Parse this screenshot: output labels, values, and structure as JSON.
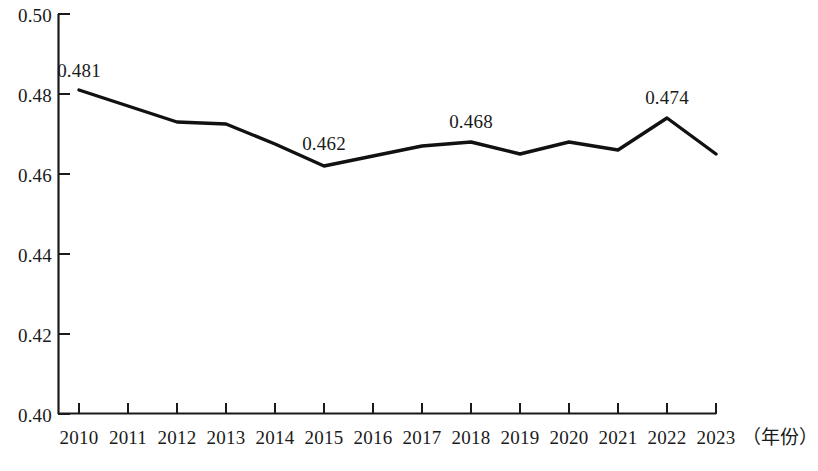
{
  "chart_data": {
    "type": "line",
    "title": "",
    "subtitle": "",
    "xlabel": "（年份）",
    "ylabel": "",
    "categories": [
      "2010",
      "2011",
      "2012",
      "2013",
      "2014",
      "2015",
      "2016",
      "2017",
      "2018",
      "2019",
      "2020",
      "2021",
      "2022",
      "2023"
    ],
    "x": [
      2010,
      2011,
      2012,
      2013,
      2014,
      2015,
      2016,
      2017,
      2018,
      2019,
      2020,
      2021,
      2022,
      2023
    ],
    "values": [
      0.481,
      0.477,
      0.473,
      0.4725,
      0.4675,
      0.462,
      0.4645,
      0.467,
      0.468,
      0.465,
      0.468,
      0.466,
      0.474,
      0.465
    ],
    "series": [
      {
        "name": "",
        "values": [
          0.481,
          0.477,
          0.473,
          0.4725,
          0.4675,
          0.462,
          0.4645,
          0.467,
          0.468,
          0.465,
          0.468,
          0.466,
          0.474,
          0.465
        ]
      }
    ],
    "annotations": [
      {
        "x": 2010,
        "y": 0.481,
        "text": "0.481"
      },
      {
        "x": 2015,
        "y": 0.462,
        "text": "0.462"
      },
      {
        "x": 2018,
        "y": 0.468,
        "text": "0.468"
      },
      {
        "x": 2022,
        "y": 0.474,
        "text": "0.474"
      }
    ],
    "ylim": [
      0.4,
      0.5
    ],
    "yticks": [
      0.4,
      0.42,
      0.44,
      0.46,
      0.48,
      0.5
    ],
    "ytick_labels": [
      "0.40",
      "0.42",
      "0.44",
      "0.46",
      "0.48",
      "0.50"
    ],
    "xtick_labels": [
      "2010",
      "2011",
      "2012",
      "2013",
      "2014",
      "2015",
      "2016",
      "2017",
      "2018",
      "2019",
      "2020",
      "2021",
      "2022",
      "2023"
    ],
    "grid": false,
    "legend": null,
    "line_color": "#111111",
    "axis_color": "#1a1a1a"
  },
  "axis": {
    "y_labels": [
      "0.50",
      "0.48",
      "0.46",
      "0.44",
      "0.42",
      "0.40"
    ],
    "x_labels": [
      "2010",
      "2011",
      "2012",
      "2013",
      "2014",
      "2015",
      "2016",
      "2017",
      "2018",
      "2019",
      "2020",
      "2021",
      "2022",
      "2023"
    ],
    "x_title": "（年份）"
  },
  "labels": {
    "p2010": "0.481",
    "p2015": "0.462",
    "p2018": "0.468",
    "p2022": "0.474"
  }
}
